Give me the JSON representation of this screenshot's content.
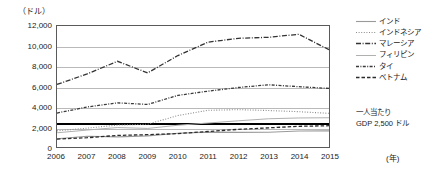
{
  "chart_data": {
    "type": "line",
    "title": "",
    "xlabel": "(年)",
    "ylabel": "(ドル)",
    "axis_unit": "（ドル）",
    "x_unit_label": "(年)",
    "categories": [
      "2006",
      "2007",
      "2008",
      "2009",
      "2010",
      "2011",
      "2012",
      "2013",
      "2014",
      "2015"
    ],
    "x": [
      2006,
      2007,
      2008,
      2009,
      2010,
      2011,
      2012,
      2013,
      2014,
      2015
    ],
    "ylim": [
      0,
      12000
    ],
    "ytick_values": [
      0,
      2000,
      4000,
      6000,
      8000,
      10000,
      12000
    ],
    "ytick_labels": [
      "0",
      "2,000",
      "4,000",
      "6,000",
      "8,000",
      "10,000",
      "12,000"
    ],
    "grid": true,
    "legend_position": "right",
    "reference_line": {
      "value": 2500,
      "label_line1": "一人当たり",
      "label_line2": "GDP 2,500 ドル"
    },
    "series": [
      {
        "name": "インド",
        "style": "solid",
        "color": "#9a9a9a",
        "values": [
          820,
          1060,
          1000,
          1100,
          1360,
          1480,
          1450,
          1460,
          1580,
          1600
        ]
      },
      {
        "name": "インドネシア",
        "style": "dotted",
        "color": "#8c8c8c",
        "values": [
          1600,
          1870,
          2170,
          2260,
          3120,
          3640,
          3700,
          3620,
          3500,
          3340
        ]
      },
      {
        "name": "マレーシア",
        "style": "dash-dot",
        "color": "#333333",
        "values": [
          6200,
          7250,
          8500,
          7350,
          9070,
          10400,
          10780,
          10880,
          11180,
          9650
        ]
      },
      {
        "name": "フィリピン",
        "style": "solid-light",
        "color": "#b0b0b0",
        "values": [
          1410,
          1680,
          1930,
          1840,
          2160,
          2380,
          2600,
          2800,
          2880,
          2900
        ]
      },
      {
        "name": "タイ",
        "style": "dash-dot-dense",
        "color": "#3a3a3a",
        "values": [
          3370,
          3970,
          4380,
          4220,
          5120,
          5540,
          5900,
          6170,
          5980,
          5810
        ]
      },
      {
        "name": "ベトナム",
        "style": "dashed",
        "color": "#2b2b2b",
        "values": [
          780,
          920,
          1150,
          1220,
          1330,
          1540,
          1750,
          1900,
          2050,
          2110
        ]
      }
    ]
  },
  "legend": {
    "items": [
      {
        "label": "インド"
      },
      {
        "label": "インドネシア"
      },
      {
        "label": "マレーシア"
      },
      {
        "label": "フィリピン"
      },
      {
        "label": "タイ"
      },
      {
        "label": "ベトナム"
      }
    ]
  }
}
